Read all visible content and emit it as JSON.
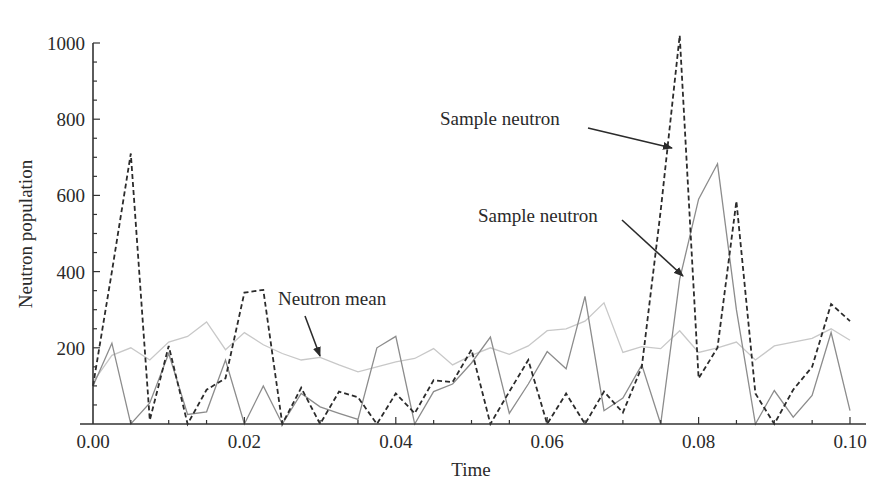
{
  "chart_data": {
    "type": "line",
    "title": "",
    "xlabel": "Time",
    "ylabel": "Neutron population",
    "xlim": [
      0.0,
      0.1
    ],
    "ylim": [
      0,
      1000
    ],
    "x_ticks": [
      "0.00",
      "0.02",
      "0.04",
      "0.06",
      "0.08",
      "0.10"
    ],
    "x_tick_values": [
      0.0,
      0.02,
      0.04,
      0.06,
      0.08,
      0.1
    ],
    "y_ticks": [
      "200",
      "400",
      "600",
      "800",
      "1000"
    ],
    "y_tick_values": [
      200,
      400,
      600,
      800,
      1000
    ],
    "x_minor_step": 0.005,
    "y_minor_step": 50,
    "grid": false,
    "legend": "none (annotations with arrows)",
    "x": [
      0.0,
      0.0025,
      0.005,
      0.0075,
      0.01,
      0.0125,
      0.015,
      0.0175,
      0.02,
      0.0225,
      0.025,
      0.0275,
      0.03,
      0.0325,
      0.035,
      0.0375,
      0.04,
      0.0425,
      0.045,
      0.0475,
      0.05,
      0.0525,
      0.055,
      0.0575,
      0.06,
      0.0625,
      0.065,
      0.0675,
      0.07,
      0.0725,
      0.075,
      0.0775,
      0.08,
      0.0825,
      0.085,
      0.0875,
      0.09,
      0.0925,
      0.095,
      0.0975,
      0.1
    ],
    "series": [
      {
        "name": "Sample neutron (dashed)",
        "style": "dashed",
        "color": "#2b2b2b",
        "values": [
          100,
          400,
          710,
          10,
          205,
          0,
          90,
          120,
          345,
          352,
          0,
          95,
          0,
          85,
          70,
          0,
          80,
          28,
          115,
          110,
          195,
          0,
          85,
          168,
          0,
          80,
          0,
          85,
          30,
          150,
          560,
          1020,
          120,
          200,
          585,
          80,
          0,
          90,
          150,
          315,
          270
        ]
      },
      {
        "name": "Sample neutron (solid)",
        "style": "solid",
        "color": "#8c8c8c",
        "values": [
          100,
          212,
          0,
          55,
          185,
          25,
          32,
          168,
          0,
          100,
          0,
          80,
          45,
          28,
          12,
          200,
          230,
          0,
          85,
          105,
          160,
          228,
          28,
          105,
          190,
          145,
          335,
          35,
          68,
          155,
          0,
          380,
          590,
          683,
          300,
          0,
          88,
          18,
          75,
          240,
          35
        ]
      },
      {
        "name": "Neutron mean",
        "style": "solid",
        "color": "#c8c8c8",
        "values": [
          110,
          180,
          200,
          168,
          215,
          230,
          268,
          195,
          240,
          208,
          185,
          168,
          175,
          155,
          137,
          150,
          163,
          172,
          198,
          155,
          180,
          200,
          183,
          205,
          245,
          250,
          270,
          318,
          188,
          203,
          198,
          245,
          188,
          200,
          215,
          168,
          205,
          215,
          225,
          250,
          220
        ]
      }
    ],
    "annotations": [
      {
        "text": "Sample neutron",
        "target_series": 0,
        "text_pos": [
          440,
          125
        ],
        "arrow_from": [
          588,
          128
        ],
        "arrow_to": [
          672,
          148
        ]
      },
      {
        "text": "Sample neutron",
        "target_series": 1,
        "text_pos": [
          478,
          222
        ],
        "arrow_from": [
          622,
          220
        ],
        "arrow_to": [
          683,
          276
        ]
      },
      {
        "text": "Neutron mean",
        "target_series": 2,
        "text_pos": [
          278,
          305
        ],
        "arrow_from": [
          305,
          316
        ],
        "arrow_to": [
          320,
          356
        ]
      }
    ]
  },
  "labels": {
    "annot_1": "Sample neutron",
    "annot_2": "Sample neutron",
    "annot_3": "Neutron mean",
    "xlabel": "Time",
    "ylabel": "Neutron population"
  }
}
